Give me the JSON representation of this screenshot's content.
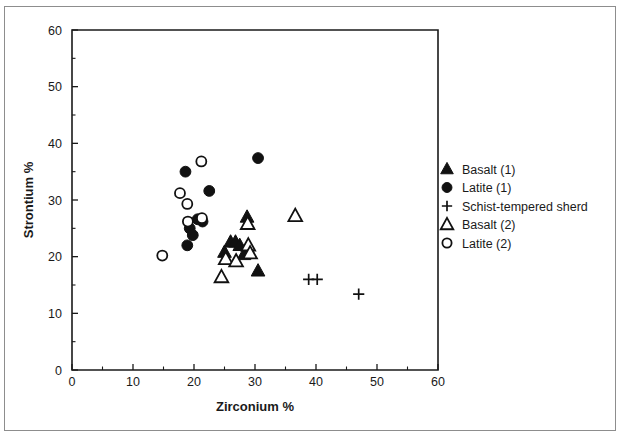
{
  "figure": {
    "background": "#ffffff",
    "frame_color": "#8d8d8d",
    "marker_color": "#111111"
  },
  "chart_data": {
    "type": "scatter",
    "title": "",
    "xlabel": "Zirconium %",
    "ylabel": "Strontium %",
    "xlim": [
      0,
      60
    ],
    "ylim": [
      0,
      60
    ],
    "xticks": [
      0,
      10,
      20,
      30,
      40,
      50,
      60
    ],
    "yticks": [
      0,
      10,
      20,
      30,
      40,
      50,
      60
    ],
    "xtick_labels": [
      "0",
      "10",
      "20",
      "30",
      "40",
      "50",
      "60"
    ],
    "ytick_labels": [
      "0",
      "10",
      "20",
      "30",
      "40",
      "50",
      "60"
    ],
    "minor_tick_step": 5,
    "grid": false,
    "legend_position": "right-outside",
    "series": [
      {
        "name": "Basalt (1)",
        "marker": "filled-triangle",
        "points": [
          [
            28.7,
            27.0
          ],
          [
            26.0,
            22.6
          ],
          [
            26.8,
            22.6
          ],
          [
            25.0,
            20.8
          ],
          [
            27.5,
            22.0
          ],
          [
            28.2,
            20.4
          ],
          [
            30.5,
            17.5
          ]
        ]
      },
      {
        "name": "Latite (1)",
        "marker": "filled-circle",
        "points": [
          [
            18.6,
            35.0
          ],
          [
            22.5,
            31.6
          ],
          [
            30.5,
            37.4
          ],
          [
            20.6,
            26.6
          ],
          [
            21.4,
            26.2
          ],
          [
            19.3,
            25.0
          ],
          [
            19.8,
            23.8
          ],
          [
            18.9,
            22.0
          ]
        ]
      },
      {
        "name": "Schist-tempered sherd",
        "marker": "plus",
        "points": [
          [
            38.8,
            16.0
          ],
          [
            40.2,
            16.0
          ],
          [
            47.0,
            13.4
          ]
        ]
      },
      {
        "name": "Basalt (2)",
        "marker": "open-triangle",
        "points": [
          [
            28.8,
            25.8
          ],
          [
            36.6,
            27.2
          ],
          [
            28.9,
            22.0
          ],
          [
            29.2,
            20.6
          ],
          [
            25.2,
            19.6
          ],
          [
            26.9,
            19.2
          ],
          [
            24.5,
            16.4
          ]
        ]
      },
      {
        "name": "Latite (2)",
        "marker": "open-circle",
        "points": [
          [
            21.2,
            36.8
          ],
          [
            17.7,
            31.2
          ],
          [
            18.9,
            29.3
          ],
          [
            21.3,
            26.8
          ],
          [
            19.0,
            26.2
          ],
          [
            14.8,
            20.2
          ]
        ]
      }
    ]
  },
  "legend": {
    "entries": [
      {
        "label": "Basalt (1)",
        "marker": "filled-triangle"
      },
      {
        "label": "Latite (1)",
        "marker": "filled-circle"
      },
      {
        "label": "Schist-tempered sherd",
        "marker": "plus"
      },
      {
        "label": "Basalt (2)",
        "marker": "open-triangle"
      },
      {
        "label": "Latite (2)",
        "marker": "open-circle"
      }
    ]
  }
}
